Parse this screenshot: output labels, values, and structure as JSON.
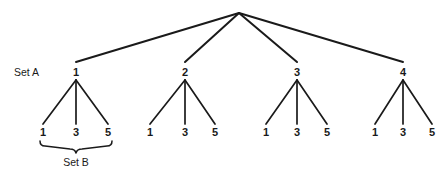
{
  "figure": {
    "type": "tree-diagram",
    "background_color": "#ffffff",
    "line_color": "#1a1a1a",
    "text_color": "#1a1a1a",
    "width": 447,
    "height": 173
  },
  "root": {
    "label": "",
    "x": 239,
    "y": 13
  },
  "annotations": {
    "set_a": {
      "text": "Set A",
      "x": 14,
      "y": 76
    },
    "set_b": {
      "text": "Set B",
      "x": 76,
      "y": 166
    }
  },
  "brace": {
    "name": "set-b-brace",
    "left_x": 40,
    "right_x": 112,
    "top_y": 141,
    "point_x": 76,
    "point_y": 153
  },
  "levels": {
    "level1_y": 76,
    "level1_edge_end_y": 62,
    "level2_y": 136,
    "level2_edge_start_y": 80,
    "level2_edge_end_y": 124
  },
  "branches": [
    {
      "label": "1",
      "x": 76,
      "children": [
        {
          "label": "1",
          "x": 43
        },
        {
          "label": "3",
          "x": 76
        },
        {
          "label": "5",
          "x": 108
        }
      ]
    },
    {
      "label": "2",
      "x": 185,
      "children": [
        {
          "label": "1",
          "x": 150
        },
        {
          "label": "3",
          "x": 185
        },
        {
          "label": "5",
          "x": 215
        }
      ]
    },
    {
      "label": "3",
      "x": 297,
      "children": [
        {
          "label": "1",
          "x": 266
        },
        {
          "label": "3",
          "x": 297
        },
        {
          "label": "5",
          "x": 327
        }
      ]
    },
    {
      "label": "4",
      "x": 403,
      "children": [
        {
          "label": "1",
          "x": 375
        },
        {
          "label": "3",
          "x": 403
        },
        {
          "label": "5",
          "x": 432
        }
      ]
    }
  ]
}
